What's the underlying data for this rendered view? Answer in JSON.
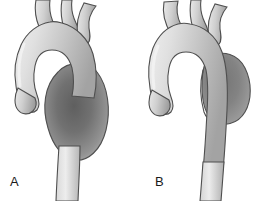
{
  "figure": {
    "background_color": "#ffffff",
    "width": 278,
    "height": 201
  },
  "colors": {
    "outline": "#4f4f4f",
    "vessel_light": "#e2e2e2",
    "vessel_mid": "#c3c3c3",
    "vessel_shadow": "#9a9a9a",
    "aneurysm_dark": "#6e6e6e",
    "aneurysm_mid": "#8a8a8a",
    "label_text": "#1a1a1a"
  },
  "panels": [
    {
      "id": "a",
      "label": "A",
      "aneurysm_type": "fusiform",
      "description": "Aortic arch with fusiform aneurysm of the descending thoracic aorta",
      "branch_vessel_count": 3,
      "parts": [
        "ascending-aorta",
        "aortic-root",
        "aortic-arch",
        "brachiocephalic-trunk",
        "left-common-carotid-artery",
        "left-subclavian-artery",
        "descending-aorta",
        "fusiform-aneurysm-sac"
      ]
    },
    {
      "id": "b",
      "label": "B",
      "aneurysm_type": "saccular",
      "description": "Aortic arch with saccular aneurysm arising from the descending thoracic aorta",
      "branch_vessel_count": 3,
      "parts": [
        "ascending-aorta",
        "aortic-root",
        "aortic-arch",
        "brachiocephalic-trunk",
        "left-common-carotid-artery",
        "left-subclavian-artery",
        "descending-aorta",
        "saccular-aneurysm-sac",
        "aneurysm-neck"
      ]
    }
  ]
}
